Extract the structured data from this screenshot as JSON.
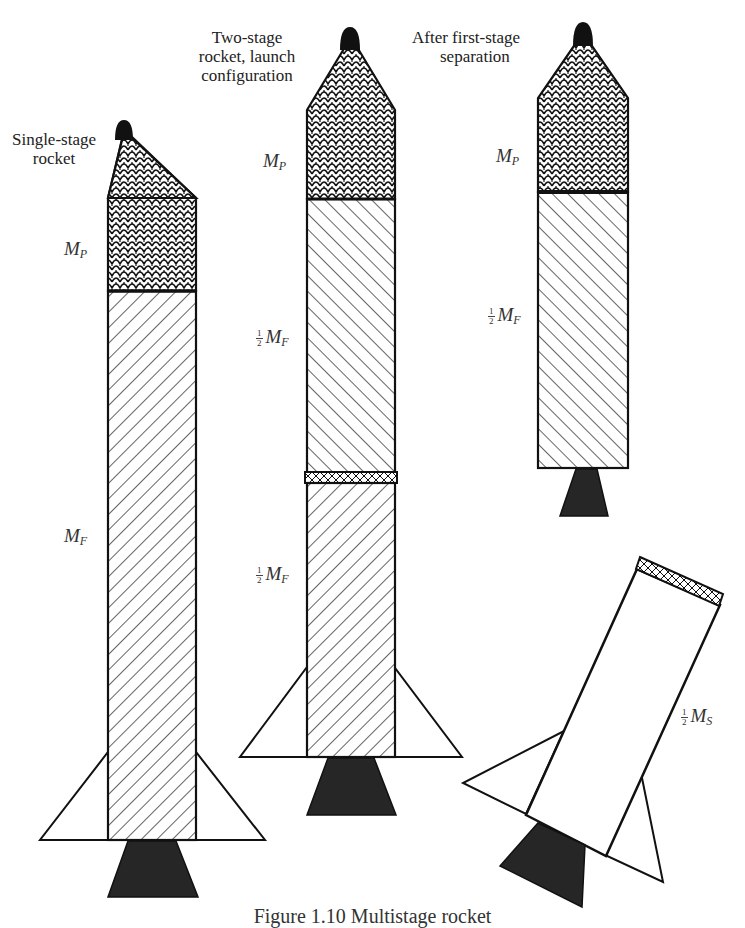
{
  "figure": {
    "caption": "Figure 1.10  Multistage rocket",
    "rockets": [
      {
        "id": "single-stage",
        "title_lines": [
          "Single-stage",
          "rocket"
        ],
        "labels": [
          {
            "frac": "",
            "mass": "M",
            "sub": "P"
          },
          {
            "frac": "",
            "mass": "M",
            "sub": "F"
          }
        ]
      },
      {
        "id": "two-stage",
        "title_lines": [
          "Two-stage",
          "rocket, launch",
          "configuration"
        ],
        "labels": [
          {
            "frac": "",
            "mass": "M",
            "sub": "P"
          },
          {
            "frac_num": "1",
            "frac_den": "2",
            "mass": "M",
            "sub": "F"
          },
          {
            "frac_num": "1",
            "frac_den": "2",
            "mass": "M",
            "sub": "F"
          }
        ]
      },
      {
        "id": "after-separation",
        "title_lines": [
          "After first-stage",
          "separation"
        ],
        "labels": [
          {
            "frac": "",
            "mass": "M",
            "sub": "P"
          },
          {
            "frac_num": "1",
            "frac_den": "2",
            "mass": "M",
            "sub": "F"
          }
        ]
      },
      {
        "id": "separated-first-stage",
        "title_lines": [],
        "labels": [
          {
            "frac_num": "1",
            "frac_den": "2",
            "mass": "M",
            "sub": "S"
          }
        ]
      }
    ],
    "legend": {
      "payload_pattern": "scale-pattern",
      "fuel_pattern": "diagonal-hatch",
      "nozzle_color": "#222222",
      "tip_color": "#111111",
      "line_color": "#111111"
    }
  }
}
